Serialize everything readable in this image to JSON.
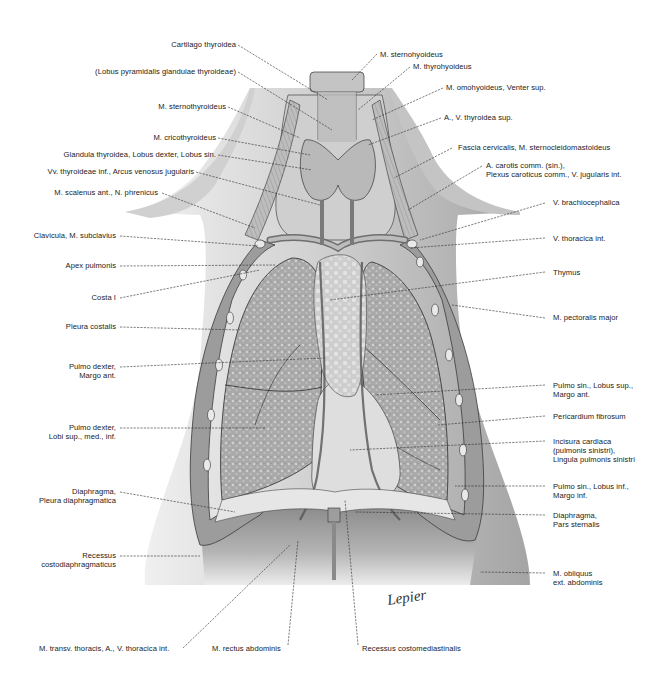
{
  "figure": {
    "type": "anatomical-illustration",
    "signature": "Lepier",
    "colors": {
      "background": "#ffffff",
      "ink": "#222222",
      "tissue_light": "#d9d9d9",
      "tissue_mid": "#a8a8a8",
      "tissue_dark": "#5a5a5a"
    }
  },
  "labels_left": [
    {
      "id": "cartilago-thyroidea",
      "lines": [
        "Cartilago thyroidea"
      ]
    },
    {
      "id": "lobus-pyramidalis",
      "lines": [
        "(Lobus pyramidalis glandulae thyroideae)"
      ]
    },
    {
      "id": "m-sternothyroideus",
      "lines": [
        "M. sternothyroideus"
      ]
    },
    {
      "id": "m-cricothyroideus",
      "lines": [
        "M. cricothyroideus"
      ]
    },
    {
      "id": "glandula-thyroidea",
      "lines": [
        "Glandula thyroidea, Lobus dexter, Lobus sin."
      ]
    },
    {
      "id": "vv-thyroideae-inf",
      "lines": [
        "Vv. thyroideae inf., Arcus venosus jugularis"
      ]
    },
    {
      "id": "m-scalenus-ant",
      "lines": [
        "M. scalenus ant., N. phrenicus"
      ]
    },
    {
      "id": "clavicula",
      "lines": [
        "Clavicula, M. subclavius"
      ]
    },
    {
      "id": "apex-pulmonis",
      "lines": [
        "Apex pulmonis"
      ]
    },
    {
      "id": "costa-i",
      "lines": [
        "Costa I"
      ]
    },
    {
      "id": "pleura-costalis",
      "lines": [
        "Pleura costalis"
      ]
    },
    {
      "id": "pulmo-dexter-margo",
      "lines": [
        "Pulmo dexter,",
        "Margo ant."
      ]
    },
    {
      "id": "pulmo-dexter-lobi",
      "lines": [
        "Pulmo dexter,",
        "Lobi sup., med., inf."
      ]
    },
    {
      "id": "diaphragma-pleura",
      "lines": [
        "Diaphragma,",
        "Pleura diaphragmatica"
      ]
    },
    {
      "id": "recessus-costodiaphragmaticus",
      "lines": [
        "Recessus",
        "costodiaphragmaticus"
      ]
    }
  ],
  "labels_right": [
    {
      "id": "m-sternohyoideus",
      "lines": [
        "M. sternohyoideus"
      ]
    },
    {
      "id": "m-thyrohyoideus",
      "lines": [
        "M. thyrohyoideus"
      ]
    },
    {
      "id": "m-omohyoideus",
      "lines": [
        "M. omohyoideus, Venter sup."
      ]
    },
    {
      "id": "a-v-thyroidea-sup",
      "lines": [
        "A., V. thyroidea sup."
      ]
    },
    {
      "id": "fascia-cervicalis",
      "lines": [
        "Fascia cervicalis, M. sternocleidomastoideus"
      ]
    },
    {
      "id": "a-carotis-comm",
      "lines": [
        "A. carotis comm. (sin.),",
        "Plexus caroticus comm., V. jugularis int."
      ]
    },
    {
      "id": "v-brachiocephalica",
      "lines": [
        "V. brachiocephalica"
      ]
    },
    {
      "id": "v-thoracica-int",
      "lines": [
        "V. thoracica int."
      ]
    },
    {
      "id": "thymus",
      "lines": [
        "Thymus"
      ]
    },
    {
      "id": "m-pectoralis-major",
      "lines": [
        "M. pectoralis major"
      ]
    },
    {
      "id": "pulmo-sin-lobus-sup",
      "lines": [
        "Pulmo sin., Lobus sup.,",
        "Margo ant."
      ]
    },
    {
      "id": "pericardium-fibrosum",
      "lines": [
        "Pericardium fibrosum"
      ]
    },
    {
      "id": "incisura-cardiaca",
      "lines": [
        "Incisura cardiaca",
        "(pulmonis sinistri),",
        "Lingula pulmonis sinistri"
      ]
    },
    {
      "id": "pulmo-sin-lobus-inf",
      "lines": [
        "Pulmo sin., Lobus inf.,",
        "Margo inf."
      ]
    },
    {
      "id": "diaphragma-pars-sternalis",
      "lines": [
        "Diaphragma,",
        "Pars sternalis"
      ]
    },
    {
      "id": "m-obliquus",
      "lines": [
        "M. obliquus",
        "ext. abdominis"
      ]
    }
  ],
  "labels_bottom": [
    {
      "id": "m-transv-thoracis",
      "lines": [
        "M. transv. thoracis, A., V. thoracica int."
      ]
    },
    {
      "id": "m-rectus-abdominis",
      "lines": [
        "M. rectus abdominis"
      ]
    },
    {
      "id": "recessus-costomediastinalis",
      "lines": [
        "Recessus costomediastinalis"
      ]
    }
  ]
}
